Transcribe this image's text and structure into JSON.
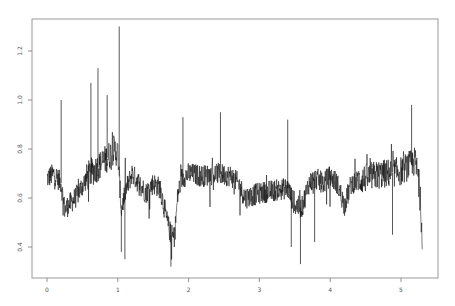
{
  "chart_data": {
    "type": "line",
    "title": "",
    "xlabel": "",
    "ylabel": "",
    "xlim": [
      -0.2,
      5.5
    ],
    "ylim": [
      0.28,
      1.33
    ],
    "x_ticks": [
      0,
      1,
      2,
      3,
      4,
      5
    ],
    "x_tick_labels": [
      "0",
      "1",
      "2",
      "3",
      "4",
      "5"
    ],
    "y_ticks": [
      0.4,
      0.6,
      0.8,
      1.0,
      1.2
    ],
    "y_tick_labels": [
      "0.4",
      "0.6",
      "0.8",
      "1.0",
      "1.2"
    ],
    "grid": false,
    "legend": null,
    "series": [
      {
        "name": "signal",
        "color": "#111111",
        "description": "dense noisy time series sampled from x=0 to x=5.3",
        "baseline_x": [
          0.0,
          0.1,
          0.2,
          0.25,
          0.3,
          0.4,
          0.5,
          0.6,
          0.7,
          0.8,
          0.9,
          0.95,
          1.0,
          1.05,
          1.1,
          1.2,
          1.3,
          1.4,
          1.5,
          1.6,
          1.7,
          1.75,
          1.8,
          1.85,
          1.9,
          2.0,
          2.2,
          2.4,
          2.6,
          2.7,
          2.8,
          2.9,
          3.0,
          3.2,
          3.4,
          3.5,
          3.6,
          3.7,
          3.8,
          3.9,
          4.0,
          4.1,
          4.2,
          4.3,
          4.4,
          4.6,
          4.8,
          5.0,
          5.1,
          5.2,
          5.25,
          5.3
        ],
        "baseline_y": [
          0.68,
          0.7,
          0.66,
          0.55,
          0.57,
          0.6,
          0.65,
          0.7,
          0.72,
          0.75,
          0.78,
          0.8,
          0.78,
          0.55,
          0.62,
          0.7,
          0.66,
          0.62,
          0.66,
          0.64,
          0.5,
          0.45,
          0.44,
          0.62,
          0.68,
          0.7,
          0.69,
          0.7,
          0.69,
          0.66,
          0.6,
          0.61,
          0.62,
          0.63,
          0.64,
          0.57,
          0.56,
          0.66,
          0.68,
          0.66,
          0.69,
          0.66,
          0.57,
          0.66,
          0.67,
          0.69,
          0.7,
          0.71,
          0.73,
          0.75,
          0.68,
          0.45
        ],
        "spikes": [
          {
            "x": 0.2,
            "y": 1.0
          },
          {
            "x": 0.62,
            "y": 1.07
          },
          {
            "x": 0.72,
            "y": 1.13
          },
          {
            "x": 0.85,
            "y": 1.02
          },
          {
            "x": 1.02,
            "y": 1.3
          },
          {
            "x": 1.05,
            "y": 0.38
          },
          {
            "x": 1.1,
            "y": 0.35
          },
          {
            "x": 1.75,
            "y": 0.32
          },
          {
            "x": 1.92,
            "y": 0.93
          },
          {
            "x": 2.45,
            "y": 0.95
          },
          {
            "x": 3.4,
            "y": 0.92
          },
          {
            "x": 3.45,
            "y": 0.4
          },
          {
            "x": 3.58,
            "y": 0.33
          },
          {
            "x": 3.78,
            "y": 0.42
          },
          {
            "x": 4.88,
            "y": 0.45
          },
          {
            "x": 5.15,
            "y": 0.98
          },
          {
            "x": 5.3,
            "y": 0.45
          }
        ]
      }
    ]
  },
  "axes": {
    "x_labels": [
      "0",
      "1",
      "2",
      "3",
      "4",
      "5"
    ],
    "y_labels": [
      "0.4",
      "0.6",
      "0.8",
      "1.0",
      "1.2"
    ]
  }
}
